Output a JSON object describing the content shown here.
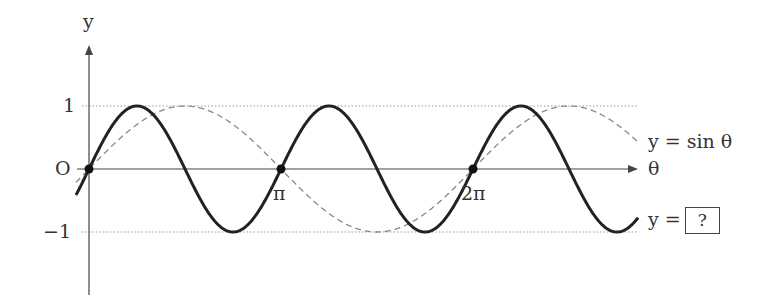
{
  "chart_data": {
    "type": "line",
    "title": "",
    "xlabel": "θ",
    "ylabel": "y",
    "x_ticks": [
      {
        "label": "O",
        "value": 0
      },
      {
        "label": "π",
        "value": 3.14159
      },
      {
        "label": "2π",
        "value": 6.28319
      }
    ],
    "y_ticks": [
      {
        "label": "1",
        "value": 1
      },
      {
        "label": "0",
        "value": 0
      },
      {
        "label": "−1",
        "value": -1
      }
    ],
    "xlim": [
      -0.2,
      7.4
    ],
    "ylim": [
      -1,
      1
    ],
    "grid": "dotted horizontal lines at y=1 and y=-1",
    "series": [
      {
        "name": "y = sin θ",
        "style": "dashed",
        "function": "sin(θ)"
      },
      {
        "name": "y = ?",
        "style": "solid bold",
        "function": "sin(2θ)"
      }
    ],
    "marked_points": [
      {
        "x": 0,
        "y": 0
      },
      {
        "x": 3.14159,
        "y": 0
      },
      {
        "x": 6.28319,
        "y": 0
      }
    ],
    "annotations": [
      "y = sin θ",
      "y = ?"
    ]
  },
  "labels": {
    "y_axis": "y",
    "x_axis": "θ",
    "origin": "O",
    "one": "1",
    "minus_one": "−1",
    "pi": "π",
    "two_pi": "2π",
    "sin_label": "y = sin θ",
    "unknown_prefix": "y =",
    "unknown_box": "?"
  },
  "colors": {
    "curve": "#222222",
    "dashed": "#888888",
    "axis": "#444444",
    "grid": "#999999"
  }
}
